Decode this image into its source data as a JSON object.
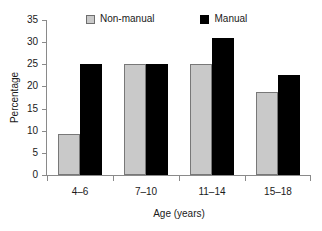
{
  "chart_data": {
    "type": "bar",
    "title": "",
    "xlabel": "Age (years)",
    "ylabel": "Percentage",
    "categories": [
      "4–6",
      "7–10",
      "11–14",
      "15–18"
    ],
    "series": [
      {
        "name": "Non-manual",
        "color": "#c9c9c9",
        "values": [
          9.2,
          25.0,
          25.0,
          18.8
        ]
      },
      {
        "name": "Manual",
        "color": "#000000",
        "values": [
          25.0,
          25.0,
          31.0,
          22.5
        ]
      }
    ],
    "ylim": [
      0,
      35
    ],
    "yticks": [
      0,
      5,
      10,
      15,
      20,
      25,
      30,
      35
    ],
    "ytick_labels": [
      "0",
      "5",
      "10",
      "15",
      "20",
      "25",
      "30",
      "35"
    ],
    "grid": false,
    "legend_position": "top"
  },
  "legend": {
    "entries": [
      {
        "label": "Non-manual",
        "swatch": "legend-swatch-nonmanual"
      },
      {
        "label": "Manual",
        "swatch": "legend-swatch-manual"
      }
    ]
  }
}
